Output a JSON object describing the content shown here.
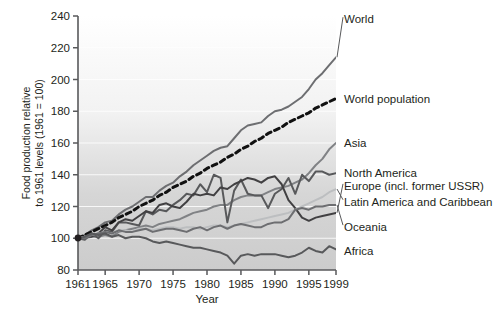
{
  "chart_data": {
    "type": "line",
    "title": "",
    "xlabel": "Year",
    "ylabel": "Food production relative to 1961 levels (1961 = 100)",
    "ylabel_line1": "Food production relative",
    "ylabel_line2": "to 1961 levels (1961 = 100)",
    "xlim": [
      1961,
      1999
    ],
    "ylim": [
      80,
      240
    ],
    "xticks": [
      1961,
      1965,
      1970,
      1975,
      1980,
      1985,
      1990,
      1995,
      1999
    ],
    "xtick_labels": [
      "1961",
      "1965",
      "1970",
      "1975",
      "1980",
      "1985",
      "1990",
      "1995",
      "1999"
    ],
    "yticks": [
      80,
      100,
      120,
      140,
      160,
      180,
      200,
      220,
      240
    ],
    "ytick_labels": [
      "80",
      "100",
      "120",
      "140",
      "160",
      "180",
      "200",
      "220",
      "240"
    ],
    "grid": "horizontal",
    "legend_position": "right-inline",
    "plot_background": "vertical gradient white to light gray",
    "colors": {
      "world": "#6d6e71",
      "world_population": "#111111",
      "asia": "#808285",
      "north_america": "#58595b",
      "europe": "#414042",
      "latin_america": "#bcbec0",
      "oceania": "#6d6e71",
      "africa": "#58595b",
      "axis": "#58595b",
      "text": "#231f20"
    },
    "x": [
      1961,
      1962,
      1963,
      1964,
      1965,
      1966,
      1967,
      1968,
      1969,
      1970,
      1971,
      1972,
      1973,
      1974,
      1975,
      1976,
      1977,
      1978,
      1979,
      1980,
      1981,
      1982,
      1983,
      1984,
      1985,
      1986,
      1987,
      1988,
      1989,
      1990,
      1991,
      1992,
      1993,
      1994,
      1995,
      1996,
      1997,
      1998,
      1999
    ],
    "series": [
      {
        "name": "World",
        "label": "World",
        "color": "#6d6e71",
        "style": "solid",
        "label_y_value": 238,
        "values": [
          100,
          102,
          105,
          107,
          110,
          111,
          115,
          118,
          120,
          123,
          126,
          126,
          130,
          133,
          135,
          139,
          142,
          146,
          149,
          152,
          155,
          157,
          158,
          163,
          168,
          171,
          172,
          173,
          177,
          180,
          181,
          183,
          186,
          189,
          194,
          200,
          204,
          209,
          214
        ]
      },
      {
        "name": "World population",
        "label": "World population",
        "color": "#111111",
        "style": "dashed",
        "label_y_value": 188,
        "values": [
          100,
          102,
          104,
          106,
          108,
          110,
          113,
          115,
          117,
          120,
          122,
          124,
          127,
          129,
          132,
          134,
          136,
          139,
          141,
          144,
          146,
          148,
          151,
          153,
          156,
          158,
          161,
          163,
          166,
          168,
          170,
          173,
          175,
          177,
          179,
          182,
          184,
          186,
          188
        ]
      },
      {
        "name": "Asia",
        "label": "Asia",
        "color": "#808285",
        "style": "solid",
        "label_y_value": 160,
        "values": [
          100,
          100,
          101,
          101,
          102,
          101,
          104,
          105,
          106,
          107,
          108,
          107,
          109,
          110,
          111,
          112,
          114,
          116,
          117,
          118,
          120,
          121,
          121,
          124,
          126,
          127,
          127,
          127,
          129,
          131,
          132,
          133,
          135,
          137,
          141,
          146,
          150,
          156,
          160
        ]
      },
      {
        "name": "North America",
        "label": "North America",
        "color": "#58595b",
        "style": "solid",
        "label_y_value": 141,
        "values": [
          100,
          99,
          103,
          100,
          105,
          104,
          110,
          110,
          109,
          108,
          117,
          115,
          118,
          117,
          121,
          124,
          128,
          127,
          134,
          129,
          140,
          138,
          110,
          130,
          137,
          128,
          127,
          127,
          119,
          128,
          131,
          138,
          128,
          140,
          136,
          142,
          142,
          140,
          141
        ]
      },
      {
        "name": "Europe (incl. former USSR)",
        "label": "Europe (incl. former USSR)",
        "color": "#414042",
        "style": "solid",
        "label_y_value": 133,
        "values": [
          100,
          101,
          101,
          103,
          107,
          105,
          110,
          112,
          111,
          114,
          117,
          116,
          121,
          122,
          120,
          119,
          123,
          128,
          127,
          128,
          127,
          132,
          131,
          134,
          136,
          138,
          137,
          135,
          138,
          139,
          134,
          124,
          119,
          113,
          111,
          113,
          114,
          115,
          116
        ]
      },
      {
        "name": "Latin America and Caribbean",
        "label": "Latin America and Caribbean",
        "color": "#bcbec0",
        "style": "solid",
        "label_y_value": 123,
        "values": [
          100,
          101,
          102,
          103,
          104,
          103,
          105,
          105,
          104,
          106,
          106,
          105,
          106,
          107,
          107,
          106,
          107,
          107,
          106,
          107,
          108,
          108,
          107,
          108,
          109,
          110,
          111,
          112,
          113,
          114,
          115,
          116,
          118,
          120,
          122,
          124,
          126,
          129,
          131
        ]
      },
      {
        "name": "Oceania",
        "label": "Oceania",
        "color": "#6d6e71",
        "style": "solid",
        "label_y_value": 107,
        "values": [
          100,
          100,
          102,
          103,
          104,
          103,
          105,
          104,
          104,
          105,
          106,
          104,
          105,
          106,
          106,
          105,
          104,
          106,
          107,
          105,
          107,
          108,
          106,
          108,
          109,
          108,
          107,
          107,
          109,
          110,
          110,
          112,
          118,
          119,
          118,
          120,
          120,
          121,
          121
        ]
      },
      {
        "name": "Africa",
        "label": "Africa",
        "color": "#58595b",
        "style": "solid",
        "label_y_value": 92,
        "values": [
          100,
          101,
          103,
          102,
          103,
          101,
          102,
          100,
          101,
          101,
          100,
          98,
          97,
          98,
          97,
          96,
          95,
          94,
          94,
          93,
          92,
          91,
          89,
          84,
          89,
          90,
          89,
          90,
          90,
          90,
          89,
          88,
          89,
          91,
          94,
          92,
          91,
          95,
          93
        ]
      }
    ]
  }
}
